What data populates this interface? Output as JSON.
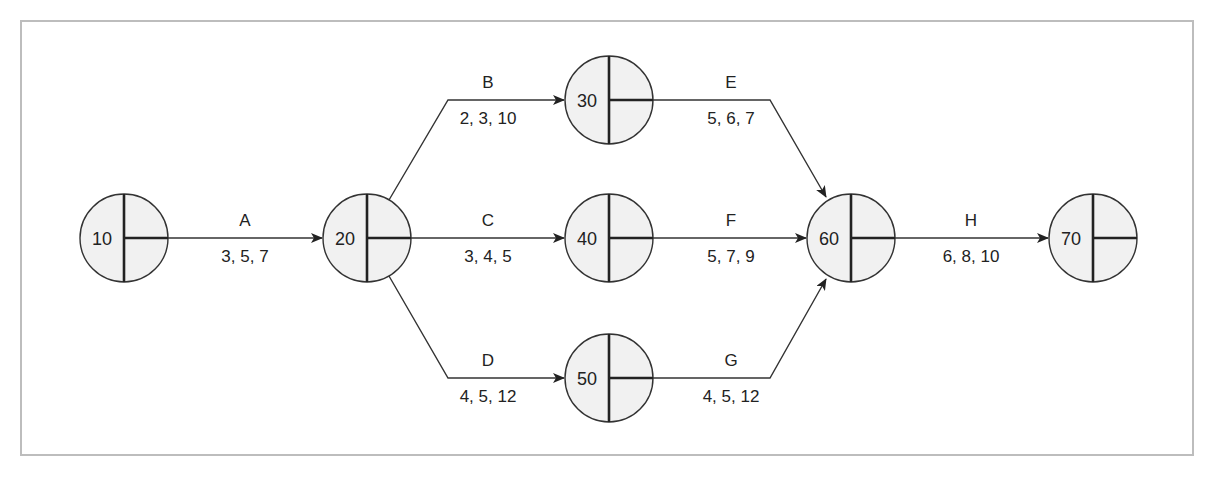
{
  "nodes": [
    {
      "id": "10",
      "cx": 124,
      "cy": 238
    },
    {
      "id": "20",
      "cx": 367,
      "cy": 238
    },
    {
      "id": "30",
      "cx": 609,
      "cy": 100
    },
    {
      "id": "40",
      "cx": 609,
      "cy": 238
    },
    {
      "id": "50",
      "cx": 609,
      "cy": 378
    },
    {
      "id": "60",
      "cx": 851,
      "cy": 238
    },
    {
      "id": "70",
      "cx": 1093,
      "cy": 238
    }
  ],
  "activities": [
    {
      "name": "A",
      "from": "10",
      "to": "20",
      "times": "3, 5, 7"
    },
    {
      "name": "B",
      "from": "20",
      "to": "30",
      "times": "2, 3, 10"
    },
    {
      "name": "C",
      "from": "20",
      "to": "40",
      "times": "3, 4, 5"
    },
    {
      "name": "D",
      "from": "20",
      "to": "50",
      "times": "4, 5, 12"
    },
    {
      "name": "E",
      "from": "30",
      "to": "60",
      "times": "5, 6, 7"
    },
    {
      "name": "F",
      "from": "40",
      "to": "60",
      "times": "5, 7, 9"
    },
    {
      "name": "G",
      "from": "50",
      "to": "60",
      "times": "4, 5, 12"
    },
    {
      "name": "H",
      "from": "60",
      "to": "70",
      "times": "6, 8, 10"
    }
  ]
}
